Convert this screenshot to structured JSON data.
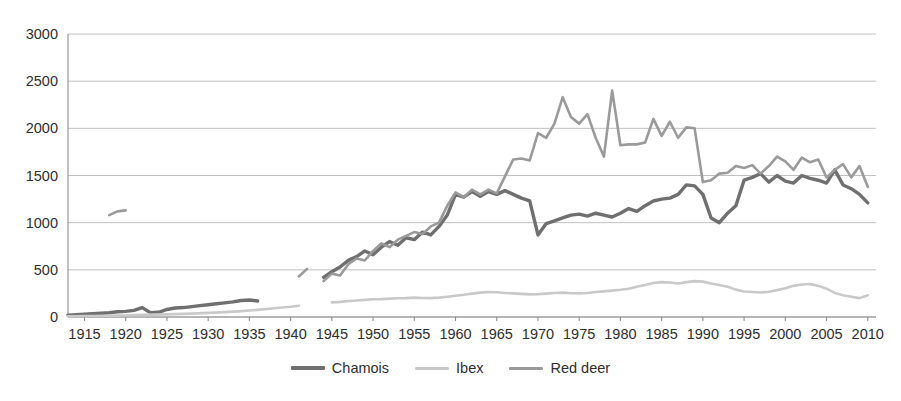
{
  "figure": {
    "title_sliver": "",
    "background": "#ffffff"
  },
  "legend": {
    "position": "bottom-center",
    "items": [
      {
        "label": "Chamois",
        "color": "#6f6f6f",
        "width": 3.4
      },
      {
        "label": "Ibex",
        "color": "#c9c9c9",
        "width": 2.6
      },
      {
        "label": "Red deer",
        "color": "#9a9a9a",
        "width": 2.6
      }
    ]
  },
  "axes": {
    "y": {
      "ticks": [
        "0",
        "500",
        "1000",
        "1500",
        "2000",
        "2500",
        "3000"
      ],
      "min": 0,
      "max": 3000,
      "step": 500,
      "grid": true
    },
    "x": {
      "ticks": [
        "1915",
        "1920",
        "1925",
        "1930",
        "1935",
        "1940",
        "1945",
        "1950",
        "1955",
        "1960",
        "1965",
        "1970",
        "1975",
        "1980",
        "1985",
        "1990",
        "1995",
        "2000",
        "2005",
        "2010"
      ],
      "min": 1913,
      "max": 2011,
      "step": 5,
      "grid": false
    }
  },
  "chart_data": {
    "type": "line",
    "title": "",
    "xlabel": "",
    "ylabel": "",
    "xlim": [
      1913,
      2011
    ],
    "ylim": [
      0,
      3000
    ],
    "grid": true,
    "legend_position": "bottom-center",
    "series": [
      {
        "name": "Chamois",
        "color": "#6f6f6f",
        "segments": [
          {
            "x": [
              1913,
              1914,
              1915,
              1916,
              1917,
              1918,
              1919,
              1920,
              1921,
              1922,
              1923,
              1924,
              1925,
              1926,
              1927,
              1928,
              1929,
              1930,
              1931,
              1932,
              1933,
              1934,
              1935,
              1936
            ],
            "y": [
              20,
              25,
              30,
              35,
              40,
              45,
              55,
              60,
              70,
              100,
              45,
              50,
              80,
              95,
              100,
              110,
              120,
              130,
              140,
              150,
              160,
              175,
              180,
              170
            ]
          },
          {
            "x": [
              1944,
              1945,
              1946,
              1947,
              1948,
              1949,
              1950,
              1951,
              1952,
              1953,
              1954,
              1955,
              1956,
              1957,
              1958,
              1959,
              1960,
              1961,
              1962,
              1963,
              1964,
              1965,
              1966,
              1967,
              1968,
              1969,
              1970,
              1971,
              1972,
              1973,
              1974,
              1975,
              1976,
              1977,
              1978,
              1979,
              1980,
              1981,
              1982,
              1983,
              1984,
              1985,
              1986,
              1987,
              1988,
              1989,
              1990,
              1991,
              1992,
              1993,
              1994,
              1995,
              1996,
              1997,
              1998,
              1999,
              2000,
              2001,
              2002,
              2003,
              2004,
              2005,
              2006,
              2007,
              2008,
              2009,
              2010
            ],
            "y": [
              420,
              480,
              530,
              600,
              640,
              700,
              660,
              740,
              800,
              760,
              840,
              820,
              900,
              870,
              960,
              1080,
              1300,
              1270,
              1330,
              1280,
              1330,
              1300,
              1340,
              1300,
              1260,
              1230,
              870,
              990,
              1020,
              1050,
              1080,
              1090,
              1070,
              1100,
              1080,
              1060,
              1100,
              1150,
              1120,
              1180,
              1230,
              1250,
              1260,
              1300,
              1400,
              1390,
              1300,
              1050,
              1000,
              1100,
              1180,
              1450,
              1480,
              1520,
              1430,
              1500,
              1440,
              1420,
              1500,
              1470,
              1450,
              1420,
              1560,
              1400,
              1360,
              1300,
              1210
            ]
          }
        ]
      },
      {
        "name": "Ibex",
        "color": "#c9c9c9",
        "segments": [
          {
            "x": [
              1913,
              1915,
              1918,
              1920,
              1922,
              1925,
              1928,
              1930,
              1932,
              1934,
              1936,
              1938,
              1940,
              1941
            ],
            "y": [
              8,
              10,
              14,
              18,
              22,
              28,
              36,
              44,
              52,
              62,
              76,
              92,
              108,
              120
            ]
          },
          {
            "x": [
              1945,
              1946,
              1947,
              1948,
              1949,
              1950,
              1951,
              1952,
              1953,
              1954,
              1955,
              1956,
              1957,
              1958,
              1959,
              1960,
              1961,
              1962,
              1963,
              1964,
              1965,
              1966,
              1967,
              1968,
              1969,
              1970,
              1971,
              1972,
              1973,
              1974,
              1975,
              1976,
              1977,
              1978,
              1979,
              1980,
              1981,
              1982,
              1983,
              1984,
              1985,
              1986,
              1987,
              1988,
              1989,
              1990,
              1991,
              1992,
              1993,
              1994,
              1995,
              1996,
              1997,
              1998,
              1999,
              2000,
              2001,
              2002,
              2003,
              2004,
              2005,
              2006,
              2007,
              2008,
              2009,
              2010
            ],
            "y": [
              155,
              160,
              168,
              175,
              182,
              188,
              190,
              195,
              198,
              200,
              205,
              202,
              200,
              205,
              215,
              225,
              235,
              248,
              258,
              265,
              262,
              255,
              250,
              245,
              240,
              242,
              248,
              255,
              258,
              252,
              250,
              255,
              265,
              272,
              280,
              288,
              300,
              320,
              340,
              360,
              370,
              365,
              355,
              370,
              380,
              375,
              355,
              340,
              320,
              290,
              270,
              265,
              260,
              268,
              285,
              305,
              330,
              345,
              350,
              330,
              300,
              255,
              230,
              215,
              200,
              230
            ]
          }
        ]
      },
      {
        "name": "Red deer",
        "color": "#9a9a9a",
        "segments": [
          {
            "x": [
              1918,
              1919,
              1920
            ],
            "y": [
              1080,
              1120,
              1130
            ]
          },
          {
            "x": [
              1941,
              1942
            ],
            "y": [
              430,
              510
            ]
          },
          {
            "x": [
              1944,
              1945,
              1946,
              1947,
              1948,
              1949,
              1950,
              1951,
              1952,
              1953,
              1954,
              1955,
              1956,
              1957,
              1958,
              1959,
              1960,
              1961,
              1962,
              1963,
              1964,
              1965,
              1966,
              1967,
              1968,
              1969,
              1970,
              1971,
              1972,
              1973,
              1974,
              1975,
              1976,
              1977,
              1978,
              1979,
              1980,
              1981,
              1982,
              1983,
              1984,
              1985,
              1986,
              1987,
              1988,
              1989,
              1990,
              1991,
              1992,
              1993,
              1994,
              1995,
              1996,
              1997,
              1998,
              1999,
              2000,
              2001,
              2002,
              2003,
              2004,
              2005,
              2006,
              2007,
              2008,
              2009,
              2010
            ],
            "y": [
              380,
              460,
              440,
              560,
              620,
              600,
              700,
              780,
              740,
              820,
              860,
              900,
              880,
              960,
              1000,
              1180,
              1320,
              1270,
              1350,
              1300,
              1350,
              1310,
              1490,
              1670,
              1680,
              1660,
              1950,
              1900,
              2050,
              2330,
              2120,
              2050,
              2150,
              1900,
              1700,
              2400,
              1820,
              1830,
              1830,
              1850,
              2100,
              1920,
              2070,
              1900,
              2010,
              2000,
              1430,
              1450,
              1520,
              1530,
              1600,
              1580,
              1610,
              1520,
              1600,
              1700,
              1650,
              1560,
              1690,
              1640,
              1670,
              1480,
              1560,
              1620,
              1480,
              1600,
              1380
            ]
          }
        ]
      }
    ]
  }
}
